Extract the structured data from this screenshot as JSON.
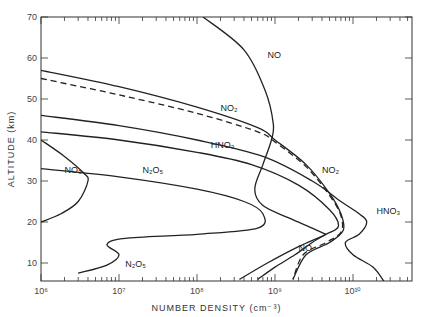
{
  "chart_data": {
    "type": "line",
    "title": "",
    "xlabel": "NUMBER DENSITY (cm⁻³)",
    "ylabel": "ALTITUDE (km)",
    "xscale": "log",
    "xlim": [
      1000000.0,
      54000000000.0
    ],
    "ylim": [
      5.5,
      70
    ],
    "x_ticks": [
      "10⁶",
      "10⁷",
      "10⁸",
      "10⁹",
      "10¹⁰"
    ],
    "y_ticks": [
      "10",
      "20",
      "30",
      "40",
      "50",
      "60",
      "70"
    ],
    "grid": false,
    "series": [
      {
        "name": "NO",
        "style": "solid",
        "points": [
          [
            120000000.0,
            70
          ],
          [
            400000000.0,
            62
          ],
          [
            750000000.0,
            52
          ],
          [
            950000000.0,
            44
          ],
          [
            900000000.0,
            40
          ],
          [
            700000000.0,
            34
          ],
          [
            550000000.0,
            28
          ],
          [
            700000000.0,
            24
          ],
          [
            1500000000.0,
            21
          ],
          [
            3000000000.0,
            18.5
          ],
          [
            4500000000.0,
            17
          ]
        ]
      },
      {
        "name": "NO (low)",
        "style": "solid",
        "points": [
          [
            4500000000.0,
            17
          ],
          [
            3000000000.0,
            15
          ],
          [
            1800000000.0,
            12
          ],
          [
            1000000000.0,
            9
          ],
          [
            600000000.0,
            6
          ]
        ]
      },
      {
        "name": "NO2",
        "style": "solid",
        "points": [
          [
            1000000.0,
            57
          ],
          [
            10000000.0,
            53
          ],
          [
            100000000.0,
            48
          ],
          [
            600000000.0,
            43
          ],
          [
            1000000000.0,
            40
          ],
          [
            2500000000.0,
            34
          ],
          [
            5000000000.0,
            27
          ],
          [
            7000000000.0,
            22
          ],
          [
            7500000000.0,
            18
          ],
          [
            5000000000.0,
            15
          ],
          [
            2500000000.0,
            12
          ],
          [
            1700000000.0,
            6
          ]
        ]
      },
      {
        "name": "NO2 (dashed)",
        "style": "dashed",
        "points": [
          [
            1000000.0,
            55
          ],
          [
            10000000.0,
            51
          ],
          [
            100000000.0,
            46.5
          ],
          [
            600000000.0,
            42
          ],
          [
            1000000000.0,
            39.5
          ],
          [
            2500000000.0,
            33.5
          ],
          [
            5000000000.0,
            26.5
          ],
          [
            7000000000.0,
            21.5
          ],
          [
            7000000000.0,
            17.5
          ],
          [
            4500000000.0,
            15
          ],
          [
            2300000000.0,
            12
          ],
          [
            1700000000.0,
            6
          ]
        ]
      },
      {
        "name": "HNO3",
        "style": "solid",
        "points": [
          [
            1000000.0,
            46
          ],
          [
            10000000.0,
            43.5
          ],
          [
            100000000.0,
            40
          ],
          [
            700000000.0,
            36
          ],
          [
            3000000000.0,
            30
          ],
          [
            7000000000.0,
            25
          ],
          [
            12000000000.0,
            22
          ],
          [
            15000000000.0,
            20
          ],
          [
            12000000000.0,
            17
          ],
          [
            8000000000.0,
            15
          ],
          [
            10000000000.0,
            12
          ],
          [
            18000000000.0,
            9
          ],
          [
            25000000000.0,
            5.5
          ]
        ]
      },
      {
        "name": "N2O5",
        "style": "solid",
        "points": [
          [
            1000000.0,
            42
          ],
          [
            10000000.0,
            40
          ],
          [
            100000000.0,
            37
          ],
          [
            500000000.0,
            34
          ],
          [
            2000000000.0,
            29
          ],
          [
            5000000000.0,
            23
          ],
          [
            6500000000.0,
            19
          ],
          [
            4500000000.0,
            17
          ],
          [
            2000000000.0,
            14
          ],
          [
            800000000.0,
            10
          ],
          [
            350000000.0,
            6
          ]
        ]
      },
      {
        "name": "NO3",
        "style": "solid",
        "points": [
          [
            1000000.0,
            40
          ],
          [
            2000000.0,
            36
          ],
          [
            3500000.0,
            32
          ],
          [
            4000000.0,
            30
          ],
          [
            3000000.0,
            25
          ],
          [
            1800000.0,
            22
          ],
          [
            1000000.0,
            20
          ]
        ]
      },
      {
        "name": "N2O5 (low)",
        "style": "solid",
        "points": [
          [
            3000000.0,
            7.5
          ],
          [
            7000000.0,
            9.5
          ],
          [
            10000000.0,
            12
          ],
          [
            7000000.0,
            14.5
          ],
          [
            12000000.0,
            16
          ],
          [
            100000000.0,
            17
          ],
          [
            600000000.0,
            18.5
          ],
          [
            700000000.0,
            22
          ],
          [
            400000000.0,
            25
          ],
          [
            100000000.0,
            28
          ],
          [
            10000000.0,
            31
          ],
          [
            1000000.0,
            33
          ]
        ]
      }
    ],
    "annotations": [
      {
        "text": "NO",
        "x": 800000000.0,
        "y": 60
      },
      {
        "text": "NO₂",
        "x": 200000000.0,
        "y": 47
      },
      {
        "text": "HNO₃",
        "x": 150000000.0,
        "y": 38
      },
      {
        "text": "NO₃",
        "x": 2000000.0,
        "y": 32
      },
      {
        "text": "N₂O₅",
        "x": 20000000.0,
        "y": 32
      },
      {
        "text": "NO₂",
        "x": 4000000000.0,
        "y": 32
      },
      {
        "text": "HNO₃",
        "x": 20000000000.0,
        "y": 22
      },
      {
        "text": "NO",
        "x": 2000000000.0,
        "y": 13
      },
      {
        "text": "N₂O₅",
        "x": 12000000.0,
        "y": 9
      }
    ]
  }
}
